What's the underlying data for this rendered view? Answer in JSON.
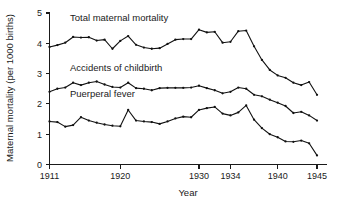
{
  "chart_data": {
    "type": "line",
    "title": "",
    "xlabel": "Year",
    "ylabel": "Maternal mortality (per 1000 births)",
    "xlim": [
      1911,
      1945
    ],
    "ylim": [
      0,
      5
    ],
    "grid": false,
    "legend_position": "inline-annotations",
    "x_ticks": [
      1911,
      1920,
      1930,
      1934,
      1940,
      1945
    ],
    "x_tick_labels": [
      "1911",
      "1920",
      "1930",
      "1934",
      "1940",
      "1945"
    ],
    "y_ticks": [
      0,
      1,
      2,
      3,
      4,
      5
    ],
    "y_tick_labels": [
      "0",
      "1",
      "2",
      "3",
      "4",
      "5"
    ],
    "x": [
      1911,
      1912,
      1913,
      1914,
      1915,
      1916,
      1917,
      1918,
      1919,
      1920,
      1921,
      1922,
      1923,
      1924,
      1925,
      1926,
      1927,
      1928,
      1929,
      1930,
      1931,
      1932,
      1933,
      1934,
      1935,
      1936,
      1937,
      1938,
      1939,
      1940,
      1941,
      1942,
      1943,
      1944,
      1945
    ],
    "series": [
      {
        "name": "Total maternal mortality",
        "label": "Total maternal mortality",
        "label_x": 1913.6,
        "label_y": 4.72,
        "values": [
          3.88,
          3.94,
          4.02,
          4.21,
          4.19,
          4.2,
          4.09,
          4.12,
          3.82,
          4.08,
          4.24,
          3.95,
          3.86,
          3.82,
          3.84,
          3.98,
          4.12,
          4.14,
          4.14,
          4.45,
          4.36,
          4.38,
          4.02,
          4.05,
          4.4,
          4.42,
          3.9,
          3.45,
          3.12,
          2.94,
          2.86,
          2.7,
          2.62,
          2.72,
          2.3
        ]
      },
      {
        "name": "Accidents of childbirth",
        "label": "Accidents of childbirth",
        "label_x": 1913.6,
        "label_y": 3.1,
        "values": [
          2.4,
          2.5,
          2.54,
          2.7,
          2.62,
          2.7,
          2.74,
          2.64,
          2.56,
          2.54,
          2.7,
          2.52,
          2.5,
          2.45,
          2.52,
          2.53,
          2.53,
          2.53,
          2.54,
          2.6,
          2.52,
          2.45,
          2.35,
          2.4,
          2.54,
          2.5,
          2.3,
          2.25,
          2.14,
          2.04,
          1.93,
          1.7,
          1.74,
          1.62,
          1.45
        ]
      },
      {
        "name": "Puerperal fever",
        "label": "Puerperal fever",
        "label_x": 1913.6,
        "label_y": 2.22,
        "values": [
          1.42,
          1.4,
          1.25,
          1.3,
          1.56,
          1.45,
          1.38,
          1.32,
          1.28,
          1.26,
          1.8,
          1.45,
          1.42,
          1.4,
          1.34,
          1.42,
          1.52,
          1.58,
          1.56,
          1.8,
          1.86,
          1.9,
          1.68,
          1.62,
          1.72,
          1.95,
          1.48,
          1.2,
          1.0,
          0.9,
          0.76,
          0.75,
          0.79,
          0.7,
          0.3
        ]
      }
    ]
  },
  "figure": {
    "background_color": "#ffffff",
    "line_color": "#111111",
    "text_color": "#1a1a1a"
  }
}
